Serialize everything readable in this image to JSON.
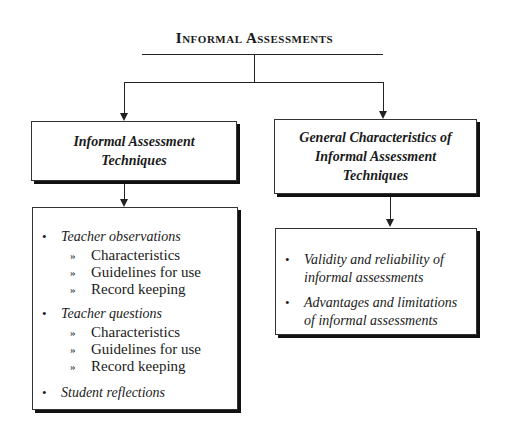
{
  "diagram": {
    "title": "Informal Assessments",
    "left_branch": {
      "header": "Informal Assessment Techniques",
      "items": [
        {
          "label": "Teacher observations",
          "subitems": [
            "Characteristics",
            "Guidelines for use",
            "Record keeping"
          ]
        },
        {
          "label": "Teacher questions",
          "subitems": [
            "Characteristics",
            "Guidelines for use",
            "Record keeping"
          ]
        },
        {
          "label": "Student reflections",
          "subitems": []
        }
      ]
    },
    "right_branch": {
      "header": "General Characteristics of Informal Assessment Techniques",
      "items": [
        {
          "label": "Validity and reliability of informal assessments"
        },
        {
          "label": "Advantages and limitations of informal assessments"
        }
      ]
    },
    "colors": {
      "line": "#222222",
      "border": "#333333",
      "shadow": "#111111",
      "background": "#ffffff"
    }
  }
}
